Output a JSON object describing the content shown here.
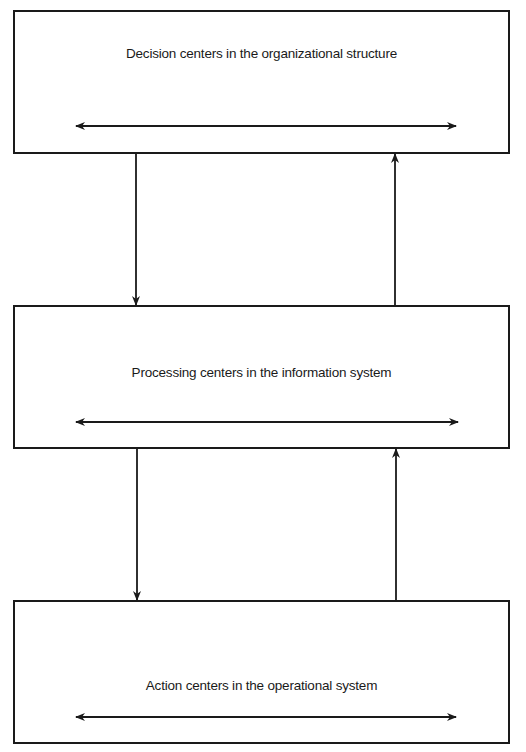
{
  "diagram": {
    "type": "hierarchical-flow",
    "boxes": [
      {
        "id": "decision",
        "label": "Decision centers in the organizational structure"
      },
      {
        "id": "processing",
        "label": "Processing centers in the information system"
      },
      {
        "id": "action",
        "label": "Action centers in the operational system"
      }
    ],
    "connections": [
      {
        "from": "decision",
        "to": "processing",
        "direction": "down"
      },
      {
        "from": "processing",
        "to": "decision",
        "direction": "up"
      },
      {
        "from": "processing",
        "to": "action",
        "direction": "down"
      },
      {
        "from": "action",
        "to": "processing",
        "direction": "up"
      }
    ],
    "internal_links": [
      {
        "box": "decision",
        "type": "bidirectional-horizontal"
      },
      {
        "box": "processing",
        "type": "bidirectional-horizontal"
      },
      {
        "box": "action",
        "type": "bidirectional-horizontal"
      }
    ],
    "colors": {
      "stroke": "#1a1a1a",
      "background": "#ffffff"
    }
  }
}
